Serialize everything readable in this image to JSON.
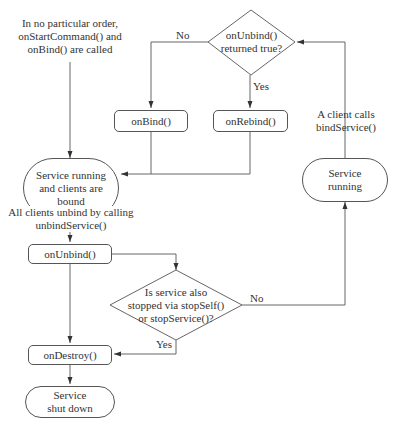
{
  "diagram": {
    "type": "flowchart",
    "notes": {
      "start_note": [
        "In no particular order,",
        "onStartCommand() and",
        "onBind() are called"
      ],
      "all_unbind": [
        "All clients unbind by calling",
        "unbindService()"
      ],
      "client_binds": [
        "A client calls",
        "bindService()"
      ]
    },
    "nodes": {
      "decision_rebind": [
        "onUnbind()",
        "returned true?"
      ],
      "on_bind": "onBind()",
      "on_rebind": "onRebind()",
      "running_bound": [
        "Service running",
        "and clients are",
        "bound"
      ],
      "service_running": [
        "Service",
        "running"
      ],
      "on_unbind": "onUnbind()",
      "decision_stopped": [
        "Is service also",
        "stopped via stopSelf()",
        "or stopService()?"
      ],
      "on_destroy": "onDestroy()",
      "shut_down": [
        "Service",
        "shut down"
      ]
    },
    "edge_labels": {
      "rebind_no": "No",
      "rebind_yes": "Yes",
      "stopped_no": "No",
      "stopped_yes": "Yes"
    },
    "edges": [
      {
        "from": "start_note",
        "to": "running_bound"
      },
      {
        "from": "decision_rebind",
        "to": "on_bind",
        "label": "No"
      },
      {
        "from": "decision_rebind",
        "to": "on_rebind",
        "label": "Yes"
      },
      {
        "from": "on_bind",
        "to": "running_bound"
      },
      {
        "from": "on_rebind",
        "to": "running_bound"
      },
      {
        "from": "running_bound",
        "to": "on_unbind",
        "label": "All clients unbind by calling unbindService()"
      },
      {
        "from": "on_unbind",
        "to": "decision_stopped"
      },
      {
        "from": "on_unbind",
        "to": "on_destroy"
      },
      {
        "from": "decision_stopped",
        "to": "on_destroy",
        "label": "Yes"
      },
      {
        "from": "decision_stopped",
        "to": "service_running",
        "label": "No"
      },
      {
        "from": "service_running",
        "to": "decision_rebind",
        "label": "A client calls bindService()"
      },
      {
        "from": "on_destroy",
        "to": "shut_down"
      }
    ],
    "colors": {
      "line": "#555555",
      "text": "#333333",
      "background": "#ffffff"
    }
  }
}
